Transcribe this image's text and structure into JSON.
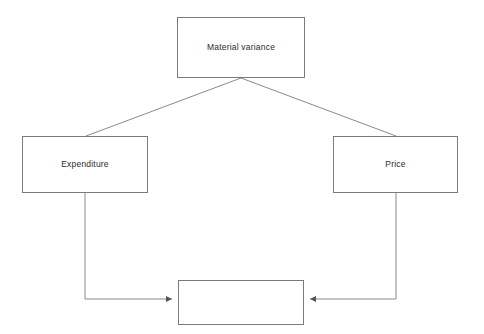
{
  "diagram": {
    "title": "Material variance",
    "type": "flowchart",
    "background_color": "#ffffff",
    "line_color": "#7a7a7a",
    "text_color": "#2b2b2b",
    "nodes": [
      {
        "id": "material-variance",
        "label": "Material variance",
        "role": "root",
        "x": 177,
        "y": 17,
        "width": 128,
        "height": 61
      },
      {
        "id": "expenditure",
        "label": "Expenditure",
        "role": "branch-left",
        "x": 22,
        "y": 136,
        "width": 126,
        "height": 57
      },
      {
        "id": "price",
        "label": "Price",
        "role": "branch-right",
        "x": 333,
        "y": 136,
        "width": 125,
        "height": 57
      },
      {
        "id": "result",
        "label": "",
        "role": "result",
        "x": 178,
        "y": 280,
        "width": 126,
        "height": 45
      }
    ],
    "connectors": [
      {
        "id": "material-variance-to-expenditure",
        "from": "material-variance",
        "to": "expenditure",
        "style": "diagonal",
        "arrowhead": false
      },
      {
        "id": "material-variance-to-price",
        "from": "material-variance",
        "to": "price",
        "style": "diagonal",
        "arrowhead": false
      },
      {
        "id": "expenditure-to-result",
        "from": "expenditure",
        "to": "result",
        "style": "elbow",
        "arrowhead": true
      },
      {
        "id": "price-to-result",
        "from": "price",
        "to": "result",
        "style": "elbow",
        "arrowhead": true
      }
    ]
  }
}
